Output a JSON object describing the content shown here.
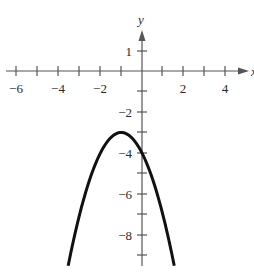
{
  "chart_data": {
    "type": "line",
    "title": "",
    "xlabel": "x",
    "ylabel": "y",
    "xlim": [
      -6,
      4.8
    ],
    "ylim": [
      -9.6,
      2
    ],
    "grid": false,
    "x_ticks": [
      -6,
      -5,
      -4,
      -3,
      -2,
      -1,
      1,
      2,
      3,
      4
    ],
    "x_tick_labels": [
      "-6",
      "-4",
      "-2",
      "2",
      "4"
    ],
    "y_ticks": [
      1,
      -1,
      -2,
      -3,
      -4,
      -5,
      -6,
      -7,
      -8,
      -9
    ],
    "y_tick_labels": [
      "1",
      "-2",
      "-4",
      "-6",
      "-8"
    ],
    "series": [
      {
        "name": "parabola",
        "equation": "y = -(x+1)^2 - 3",
        "vertex": [
          -1,
          -3
        ],
        "y_intercept": -4,
        "x": [
          -3.55,
          -3,
          -2.5,
          -2,
          -1.5,
          -1,
          -0.5,
          0,
          0.5,
          1,
          1.55
        ],
        "values": [
          -9.5,
          -7,
          -5.25,
          -4,
          -3.25,
          -3,
          -3.25,
          -4,
          -5.25,
          -7,
          -9.5
        ]
      }
    ]
  },
  "labels": {
    "y_axis": "y",
    "x_axis": "x",
    "xt": {
      "m6": "−6",
      "m4": "−4",
      "m2": "−2",
      "p2": "2",
      "p4": "4"
    },
    "yt": {
      "p1": "1",
      "m2": "−2",
      "m4": "−4",
      "m6": "−6",
      "m8": "−8"
    }
  }
}
